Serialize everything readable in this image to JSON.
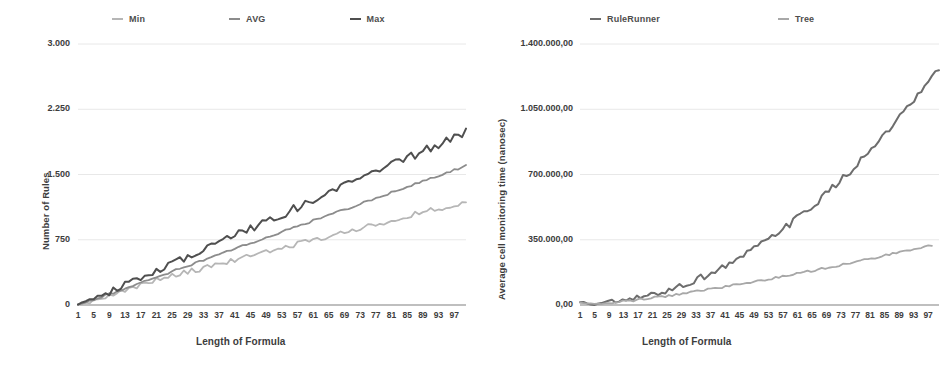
{
  "chart_data": [
    {
      "id": "left",
      "type": "line",
      "title": "",
      "xlabel": "Length of Formula",
      "ylabel": "Number of Rules",
      "xlim": [
        1,
        100
      ],
      "ylim": [
        0,
        3000
      ],
      "grid": true,
      "legend_position": "top",
      "x_ticks": [
        "1",
        "5",
        "9",
        "13",
        "17",
        "21",
        "25",
        "29",
        "33",
        "37",
        "41",
        "45",
        "49",
        "53",
        "57",
        "61",
        "65",
        "69",
        "73",
        "77",
        "81",
        "85",
        "89",
        "93",
        "97"
      ],
      "y_ticks": [
        "0",
        "750",
        "1.500",
        "2.250",
        "3.000"
      ],
      "y_tick_values": [
        0,
        750,
        1500,
        2250,
        3000
      ],
      "series": [
        {
          "name": "Min",
          "color": "#b6b6b6",
          "values": [
            5,
            9,
            16,
            24,
            33,
            44,
            55,
            66,
            77,
            88,
            98,
            108,
            119,
            128,
            137,
            147,
            156,
            166,
            175,
            184,
            192,
            200,
            209,
            218,
            226,
            234,
            242,
            251,
            259,
            267,
            274,
            282,
            290,
            299,
            307,
            315,
            322,
            330,
            338,
            346,
            353,
            361,
            369,
            377,
            384,
            392,
            400,
            408,
            415,
            423,
            431,
            439,
            446,
            454,
            462,
            470,
            477,
            485,
            493,
            501,
            508,
            516,
            524,
            532,
            539,
            547,
            555,
            563,
            570,
            578,
            586,
            594,
            601,
            609,
            617,
            625,
            632,
            640,
            648,
            656,
            663,
            671,
            679,
            687,
            694,
            702,
            710,
            718,
            725,
            733,
            741,
            749,
            756,
            764,
            772,
            780,
            787,
            795,
            803,
            811
          ],
          "values_jitter": true
        },
        {
          "name": "AVG",
          "color": "#8c8c8c",
          "values": [
            8,
            18,
            31,
            45,
            60,
            76,
            92,
            108,
            124,
            140,
            156,
            172,
            188,
            204,
            220,
            236,
            252,
            268,
            284,
            300,
            316,
            332,
            348,
            364,
            380,
            396,
            412,
            428,
            444,
            460,
            476,
            492,
            508,
            524,
            540,
            556,
            572,
            588,
            604,
            620,
            636,
            652,
            668,
            684,
            700,
            716,
            732,
            748,
            764,
            780,
            796,
            812,
            828,
            844,
            860,
            876,
            892,
            908,
            924,
            940,
            956,
            972,
            988,
            1004,
            1020,
            1036,
            1052,
            1068,
            1084,
            1100,
            1116,
            1132,
            1148,
            1164,
            1180,
            1196,
            1212,
            1228,
            1244,
            1260,
            1276,
            1292,
            1308,
            1324,
            1340,
            1356,
            1372,
            1388,
            1404,
            1420,
            1436,
            1452,
            1468,
            1484,
            1500,
            1516,
            1532,
            1548,
            1564,
            1580
          ]
        },
        {
          "name": "Max",
          "color": "#4f4f4f",
          "values": [
            12,
            27,
            46,
            66,
            88,
            110,
            133,
            156,
            180,
            203,
            227,
            250,
            274,
            298,
            321,
            345,
            369,
            392,
            416,
            440,
            463,
            487,
            511,
            534,
            558,
            582,
            605,
            629,
            653,
            676,
            700,
            724,
            747,
            771,
            795,
            818,
            842,
            866,
            889,
            913,
            937,
            960,
            984,
            1008,
            1031,
            1055,
            1079,
            1102,
            1126,
            1150,
            1173,
            1197,
            1221,
            1244,
            1268,
            1292,
            1315,
            1339,
            1363,
            1386,
            1410,
            1434,
            1457,
            1481,
            1505,
            1528,
            1552,
            1576,
            1599,
            1623,
            1647,
            1670,
            1694,
            1718,
            1741,
            1765,
            1789,
            1812,
            1836,
            1860,
            1883,
            1907,
            1931,
            1954,
            1978,
            2002,
            2025,
            2049,
            2073,
            2096,
            2120,
            2144,
            2167,
            2191,
            2215,
            2238,
            2262,
            2286,
            2309,
            2333
          ]
        }
      ]
    },
    {
      "id": "right",
      "type": "line",
      "title": "",
      "xlabel": "Length of Formula",
      "ylabel": "Average cell monitoring time (nanosec)",
      "xlim": [
        1,
        100
      ],
      "ylim": [
        0,
        1400000
      ],
      "grid": true,
      "legend_position": "top",
      "x_ticks": [
        "1",
        "5",
        "9",
        "13",
        "17",
        "21",
        "25",
        "29",
        "33",
        "37",
        "41",
        "45",
        "49",
        "53",
        "57",
        "61",
        "65",
        "69",
        "73",
        "77",
        "81",
        "85",
        "89",
        "93",
        "97"
      ],
      "y_ticks": [
        "0,00",
        "350.000,00",
        "700.000,00",
        "1.050.000,00",
        "1.400.000,00"
      ],
      "y_tick_values": [
        0,
        350000,
        700000,
        1050000,
        1400000
      ],
      "series": [
        {
          "name": "RuleRunner",
          "color": "#6d6d6d",
          "values": [
            30000,
            24000,
            18000,
            14000,
            12000,
            13000,
            16000,
            19000,
            23000,
            27000,
            32000,
            37000,
            43000,
            49000,
            56000,
            63000,
            71000,
            79000,
            88000,
            97000,
            107000,
            117000,
            128000,
            139000,
            151000,
            163000,
            176000,
            189000,
            203000,
            217000,
            232000,
            247000,
            263000,
            279000,
            296000,
            313000,
            331000,
            349000,
            368000,
            387000,
            407000,
            427000,
            448000,
            469000,
            491000,
            513000,
            536000,
            559000,
            583000,
            607000,
            632000,
            657000,
            683000,
            709000,
            736000,
            763000,
            791000,
            819000,
            848000,
            877000,
            907000,
            937000,
            968000,
            999000,
            1031000,
            1063000,
            1096000,
            1129000,
            1163000,
            1197000,
            1232000,
            1267000,
            1303000,
            1339000,
            1376000,
            1413000,
            1451000,
            1489000,
            1528000,
            1567000,
            1607000,
            1647000,
            1688000,
            1729000,
            1771000,
            1813000,
            1856000,
            1899000,
            1943000,
            1987000,
            2032000,
            2077000,
            2123000,
            2169000,
            2216000,
            2263000,
            2311000,
            2359000,
            2408000,
            2457000,
            2507000,
            2557000
          ]
        },
        {
          "name": "Tree",
          "color": "#a8a8a8",
          "values": [
            28000,
            22000,
            17000,
            14000,
            13000,
            14000,
            16000,
            19000,
            22000,
            26000,
            30000,
            34000,
            38000,
            43000,
            47000,
            52000,
            57000,
            62000,
            67000,
            72000,
            77000,
            83000,
            88000,
            94000,
            99000,
            105000,
            111000,
            117000,
            123000,
            129000,
            135000,
            141000,
            147000,
            153000,
            160000,
            166000,
            172000,
            179000,
            185000,
            192000,
            198000,
            205000,
            212000,
            218000,
            225000,
            232000,
            239000,
            246000,
            253000,
            260000,
            267000,
            274000,
            281000,
            288000,
            296000,
            303000,
            310000,
            318000,
            325000,
            333000,
            340000,
            348000,
            355000,
            363000,
            371000,
            378000,
            386000,
            394000,
            402000,
            410000,
            418000,
            426000,
            434000,
            442000,
            450000,
            458000,
            466000,
            475000,
            483000,
            491000,
            500000,
            508000,
            517000,
            525000,
            534000,
            542000,
            551000,
            560000,
            568000,
            577000,
            586000,
            595000,
            604000,
            613000,
            622000,
            631000,
            640000,
            649000,
            658000,
            667000
          ]
        }
      ]
    }
  ],
  "left_chart": {
    "legend": [
      {
        "label": "Min",
        "color": "#b6b6b6"
      },
      {
        "label": "AVG",
        "color": "#8c8c8c"
      },
      {
        "label": "Max",
        "color": "#4f4f4f"
      }
    ],
    "y_axis_title": "Number of Rules",
    "x_axis_title": "Length of Formula",
    "y_ticks": [
      "3.000",
      "2.250",
      "1.500",
      "750",
      "0"
    ],
    "x_ticks": [
      "1",
      "5",
      "9",
      "13",
      "17",
      "21",
      "25",
      "29",
      "33",
      "37",
      "41",
      "45",
      "49",
      "53",
      "57",
      "61",
      "65",
      "69",
      "73",
      "77",
      "81",
      "85",
      "89",
      "93",
      "97"
    ]
  },
  "right_chart": {
    "legend": [
      {
        "label": "RuleRunner",
        "color": "#6d6d6d"
      },
      {
        "label": "Tree",
        "color": "#a8a8a8"
      }
    ],
    "y_axis_title": "Average cell monitoring time (nanosec)",
    "x_axis_title": "Length of Formula",
    "y_ticks": [
      "1.400.000,00",
      "1.050.000,00",
      "700.000,00",
      "350.000,00",
      "0,00"
    ],
    "x_ticks": [
      "1",
      "5",
      "9",
      "13",
      "17",
      "21",
      "25",
      "29",
      "33",
      "37",
      "41",
      "45",
      "49",
      "53",
      "57",
      "61",
      "65",
      "69",
      "73",
      "77",
      "81",
      "85",
      "89",
      "93",
      "97"
    ]
  },
  "colors": {
    "gridline": "#e2e2e2",
    "axis": "#808080",
    "text": "#3d3d3d"
  }
}
